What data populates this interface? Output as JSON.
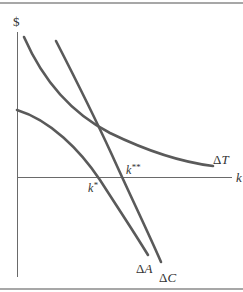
{
  "diagram": {
    "y_axis_label": "$",
    "x_axis_label": "k",
    "curves": [
      {
        "name": "delta-T",
        "label": "ΔT",
        "label_prefix": "Δ",
        "label_var": "T",
        "shape": "downward-sloping convex"
      },
      {
        "name": "delta-C",
        "label": "ΔC",
        "label_prefix": "Δ",
        "label_var": "C",
        "shape": "steep downward line"
      },
      {
        "name": "delta-A",
        "label": "ΔA",
        "label_prefix": "Δ",
        "label_var": "A",
        "shape": "downward-sloping concave"
      }
    ],
    "points": [
      {
        "name": "k-star",
        "base": "k",
        "superscript": "*"
      },
      {
        "name": "k-double-star",
        "base": "k",
        "superscript": "**"
      }
    ],
    "colors": {
      "curve": "#5a5a5a",
      "axis": "#6a6a6a",
      "border": "#8a8a8a",
      "text": "#333333"
    }
  }
}
